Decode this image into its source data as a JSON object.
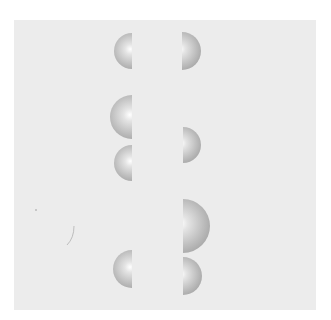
{
  "figure": {
    "background_color": "#ececec",
    "sphere_color": "#bdbdbd",
    "hemispheres": [
      {
        "id": "L1",
        "side": "left",
        "edge_x": 132,
        "center_y": 51,
        "radius": 18
      },
      {
        "id": "R1",
        "side": "right",
        "edge_x": 182,
        "center_y": 51,
        "radius": 19
      },
      {
        "id": "L2",
        "side": "left",
        "edge_x": 132,
        "center_y": 117,
        "radius": 22
      },
      {
        "id": "L3",
        "side": "left",
        "edge_x": 132,
        "center_y": 163,
        "radius": 18
      },
      {
        "id": "R2",
        "side": "right",
        "edge_x": 183,
        "center_y": 145,
        "radius": 18
      },
      {
        "id": "R3",
        "side": "right",
        "edge_x": 183,
        "center_y": 226,
        "radius": 27
      },
      {
        "id": "L4",
        "side": "left",
        "edge_x": 132,
        "center_y": 269,
        "radius": 19
      },
      {
        "id": "R4",
        "side": "right",
        "edge_x": 183,
        "center_y": 276,
        "radius": 19
      }
    ]
  }
}
